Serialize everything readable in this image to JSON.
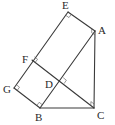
{
  "diagram": {
    "points": {
      "E": {
        "label": "E",
        "x": 68,
        "y": 12,
        "lx": 62,
        "ly": 9
      },
      "A": {
        "label": "A",
        "x": 95,
        "y": 31,
        "lx": 98,
        "ly": 34
      },
      "F": {
        "label": "F",
        "x": 32,
        "y": 60,
        "lx": 22,
        "ly": 63
      },
      "G": {
        "label": "G",
        "x": 14,
        "y": 88,
        "lx": 3,
        "ly": 93
      },
      "D": {
        "label": "D",
        "x": 61,
        "y": 81,
        "lx": 45,
        "ly": 88
      },
      "B": {
        "label": "B",
        "x": 40,
        "y": 108,
        "lx": 35,
        "ly": 121
      },
      "C": {
        "label": "C",
        "x": 94,
        "y": 108,
        "lx": 97,
        "ly": 119
      }
    },
    "segments": [
      [
        "E",
        "A"
      ],
      [
        "A",
        "C"
      ],
      [
        "B",
        "C"
      ],
      [
        "A",
        "B"
      ],
      [
        "E",
        "G"
      ],
      [
        "G",
        "B"
      ],
      [
        "F",
        "C"
      ]
    ],
    "right_angles": [
      "E",
      "A",
      "F",
      "D",
      "G",
      "B",
      "C"
    ]
  }
}
